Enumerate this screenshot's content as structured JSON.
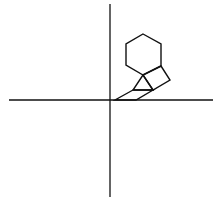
{
  "canvas": {
    "width": 224,
    "height": 199,
    "background": "#ffffff"
  },
  "style": {
    "stroke": "#111111",
    "axis_width": 1.3,
    "shape_width": 1.4
  },
  "axes": {
    "vertical": {
      "x": 110,
      "y1": 4,
      "y2": 197
    },
    "horizontal": {
      "y": 100,
      "x1": 9,
      "x2": 213
    }
  },
  "shapes": {
    "hexagon": "143,34 161,44 161,66 143,75 126,65 126,44",
    "square": "161,66 170,80 153,90 143,75",
    "triangle": "143,75 133,90 153,90",
    "parallelogram": "133,90 115,100 136,100 153,90"
  }
}
